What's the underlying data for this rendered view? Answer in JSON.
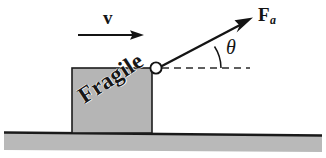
{
  "figure": {
    "background_color": "#ffffff",
    "ink_color": "#141414"
  },
  "ground": {
    "name": "ground-surface",
    "fill_color": "#b9b9b9",
    "line_color": "#1a1a1a"
  },
  "block": {
    "label": "Fragile",
    "fill_color": "#b5b5b5",
    "border_color": "#1c1c1c",
    "rotation_deg": -33
  },
  "attachment": {
    "name": "rope-ring",
    "fill_color": "#ffffff",
    "border_color": "#141414"
  },
  "velocity": {
    "label": "v",
    "description": "velocity arrow pointing right"
  },
  "force": {
    "label": "F",
    "subscript": "a",
    "description": "applied force arrow pointing up and to the right"
  },
  "angle": {
    "label": "θ",
    "description": "angle between applied force and horizontal dashed reference line"
  },
  "reference_line": {
    "name": "horizontal-dashed-reference",
    "style": "dashed"
  }
}
